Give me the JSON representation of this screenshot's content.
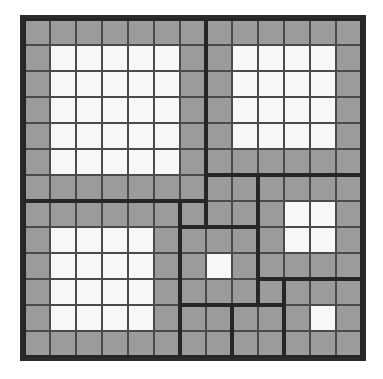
{
  "puzzle": {
    "grid_size": 13,
    "cell_px": 26,
    "colors": {
      "border": "#2b2b2b",
      "cell_gray": "#9b9b9b",
      "cell_white": "#f7f7f7",
      "grid_line": "#4a4a4a"
    },
    "pieces": [
      {
        "id": "A",
        "row": 0,
        "col": 0,
        "size": 7,
        "white": {
          "row": 1,
          "col": 1,
          "h": 5,
          "w": 5
        }
      },
      {
        "id": "B",
        "row": 0,
        "col": 7,
        "size": 6,
        "white": {
          "row": 1,
          "col": 8,
          "h": 4,
          "w": 4
        }
      },
      {
        "id": "C",
        "row": 7,
        "col": 0,
        "size": 6,
        "white": {
          "row": 8,
          "col": 1,
          "h": 4,
          "w": 4
        }
      },
      {
        "id": "D",
        "row": 6,
        "col": 7,
        "size": 2,
        "white": null
      },
      {
        "id": "E",
        "row": 7,
        "col": 6,
        "size": 1,
        "white": null
      },
      {
        "id": "F",
        "row": 6,
        "col": 9,
        "size": 4,
        "white": {
          "row": 7,
          "col": 10,
          "h": 2,
          "w": 2
        }
      },
      {
        "id": "G",
        "row": 8,
        "col": 6,
        "size": 3,
        "white": {
          "row": 9,
          "col": 7,
          "h": 1,
          "w": 1
        }
      },
      {
        "id": "H",
        "row": 10,
        "col": 9,
        "size": 1,
        "white": null
      },
      {
        "id": "I",
        "row": 10,
        "col": 10,
        "size": 3,
        "white": {
          "row": 11,
          "col": 11,
          "h": 1,
          "w": 1
        }
      },
      {
        "id": "J",
        "row": 11,
        "col": 6,
        "size": 2,
        "white": null
      },
      {
        "id": "K",
        "row": 11,
        "col": 8,
        "size": 2,
        "white": null
      }
    ]
  }
}
